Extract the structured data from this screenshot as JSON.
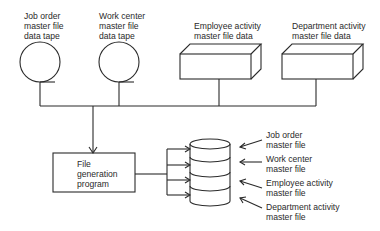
{
  "diagram": {
    "type": "data-flow",
    "inputs": [
      {
        "id": "job_order_tape",
        "shape": "magnetic-tape",
        "label_lines": [
          "Job order",
          "master file",
          "data tape"
        ]
      },
      {
        "id": "work_center_tape",
        "shape": "magnetic-tape",
        "label_lines": [
          "Work center",
          "master file",
          "data tape"
        ]
      },
      {
        "id": "employee_activity_data",
        "shape": "box-3d",
        "label_lines": [
          "Employee activity",
          "master file data"
        ]
      },
      {
        "id": "department_activity_data",
        "shape": "box-3d",
        "label_lines": [
          "Department activity",
          "master file data"
        ]
      }
    ],
    "process": {
      "id": "file_generation_program",
      "shape": "rectangle",
      "label_lines": [
        "File",
        "generation",
        "program"
      ]
    },
    "output": {
      "id": "master_file_database",
      "shape": "disk-cylinder",
      "segments": [
        {
          "label_lines": [
            "Job order",
            "master file"
          ]
        },
        {
          "label_lines": [
            "Work center",
            "master file"
          ]
        },
        {
          "label_lines": [
            "Employee activity",
            "master file"
          ]
        },
        {
          "label_lines": [
            "Department activity",
            "master file"
          ]
        }
      ]
    },
    "edges": [
      {
        "from": "job_order_tape",
        "to": "file_generation_program"
      },
      {
        "from": "work_center_tape",
        "to": "file_generation_program"
      },
      {
        "from": "employee_activity_data",
        "to": "file_generation_program"
      },
      {
        "from": "department_activity_data",
        "to": "file_generation_program"
      },
      {
        "from": "file_generation_program",
        "to": "master_file_database",
        "count": 4
      }
    ],
    "colors": {
      "stroke": "#2a2a2a",
      "background": "#ffffff"
    }
  }
}
